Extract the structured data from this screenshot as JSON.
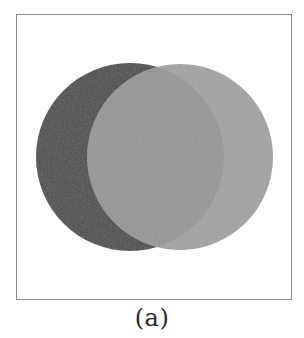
{
  "figure": {
    "caption": "(a)",
    "frame": {
      "x": 16,
      "y": 14,
      "width": 275,
      "height": 285,
      "border_color": "#8a8a8a"
    },
    "circles": [
      {
        "name": "dark-circle",
        "cx": 130,
        "cy": 157,
        "r": 94,
        "fill": "#4b4b4b",
        "opacity": 1
      },
      {
        "name": "light-circle",
        "cx": 180,
        "cy": 157,
        "r": 93,
        "fill": "#9b9b9b",
        "opacity": 0.93
      }
    ]
  }
}
